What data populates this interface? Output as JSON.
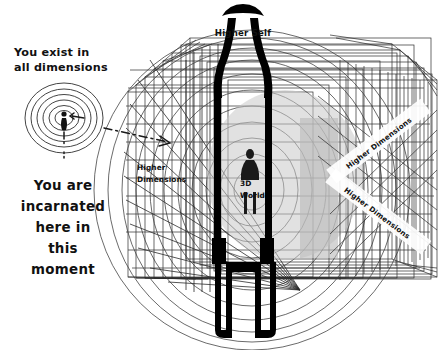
{
  "diagram": {
    "title_hidden": "",
    "labels": {
      "higher_self": "Higher Self",
      "higher_dimensions_left": "Higher",
      "higher_dimensions_left2": "Dimensions",
      "world_3d_line1": "3D",
      "world_3d_line2": "World",
      "higher_dimensions_diag_top": "Higher Dimensions",
      "higher_dimensions_diag_bottom": "Higher Dimensions"
    },
    "captions": {
      "exist_line1": "You exist in",
      "exist_line2": "all dimensions",
      "incarnated_line1": "You are",
      "incarnated_line2": "incarnated",
      "incarnated_line3": "here in",
      "incarnated_line4": "this",
      "incarnated_line5": "moment"
    },
    "colors": {
      "ink": "#000000",
      "line": "#2b2b2b",
      "sphere_gray": "#c9c9c9",
      "panel_gray": "#b9b9b9",
      "background": "#ffffff"
    },
    "counts": {
      "aura_rings": 7,
      "nested_frames": 9,
      "dome_arcs": 12
    }
  }
}
